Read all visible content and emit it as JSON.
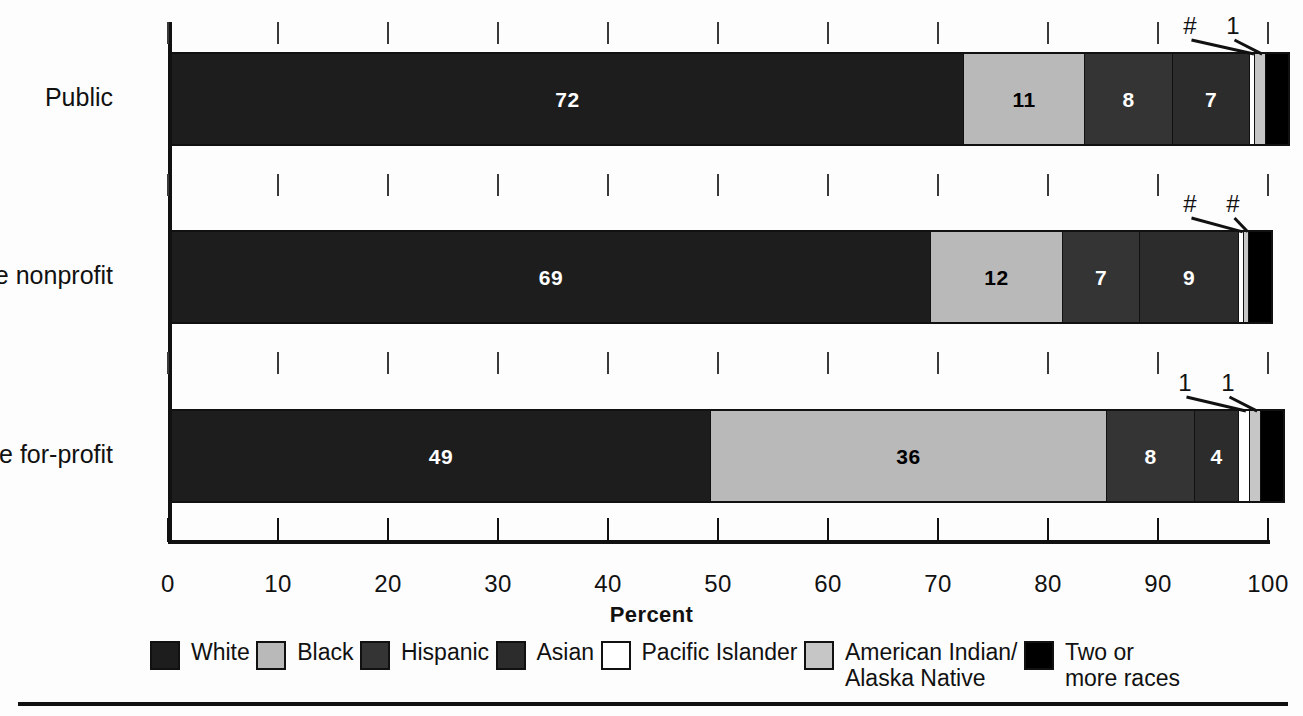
{
  "chart_data": {
    "type": "bar",
    "subtype": "stacked-horizontal-100",
    "title": "",
    "xlabel": "Percent",
    "ylabel": "",
    "xlim": [
      0,
      100
    ],
    "xticks": [
      0,
      10,
      20,
      30,
      40,
      50,
      60,
      70,
      80,
      90,
      100
    ],
    "xticklabels": [
      "0",
      "10",
      "20",
      "30",
      "40",
      "50",
      "60",
      "70",
      "80",
      "90",
      "100"
    ],
    "grid": false,
    "legend_position": "bottom",
    "categories": [
      "Public",
      "Private nonprofit",
      "Private for-profit"
    ],
    "series": [
      {
        "name": "White",
        "values": [
          72,
          69,
          49
        ],
        "color": "#1d1d1d"
      },
      {
        "name": "Black",
        "values": [
          11,
          12,
          36
        ],
        "color": "#b9b9b9"
      },
      {
        "name": "Hispanic",
        "values": [
          8,
          7,
          8
        ],
        "color": "#343434"
      },
      {
        "name": "Asian",
        "values": [
          7,
          9,
          4
        ],
        "color": "#2c2c2c"
      },
      {
        "name": "Pacific Islander",
        "values": [
          0,
          0,
          1
        ],
        "color": "#ffffff"
      },
      {
        "name": "American Indian/\nAlaska Native",
        "values": [
          1,
          0,
          1
        ],
        "color": "#c6c6c6"
      },
      {
        "name": "Two or\nmore races",
        "values": [
          2,
          2,
          2
        ],
        "color": "#000000"
      }
    ],
    "bar_labels": [
      [
        "72",
        "11",
        "8",
        "7",
        "#",
        "1",
        "2"
      ],
      [
        "69",
        "12",
        "7",
        "9",
        "#",
        "#",
        "2"
      ],
      [
        "49",
        "36",
        "8",
        "4",
        "1",
        "1",
        "2"
      ]
    ],
    "callout_symbol_hash": "#",
    "callout_symbol_one": "1",
    "note": "# = rounds to zero"
  },
  "axis": {
    "x_title": "Percent",
    "ticks": [
      {
        "value": 0,
        "label": "0"
      },
      {
        "value": 10,
        "label": "10"
      },
      {
        "value": 20,
        "label": "20"
      },
      {
        "value": 30,
        "label": "30"
      },
      {
        "value": 40,
        "label": "40"
      },
      {
        "value": 50,
        "label": "50"
      },
      {
        "value": 60,
        "label": "60"
      },
      {
        "value": 70,
        "label": "70"
      },
      {
        "value": 80,
        "label": "80"
      },
      {
        "value": 90,
        "label": "90"
      },
      {
        "value": 100,
        "label": "100"
      }
    ]
  },
  "categories": [
    {
      "label": "Public"
    },
    {
      "label": "Private nonprofit"
    },
    {
      "label": "Private for-profit"
    }
  ],
  "legend": {
    "items": [
      {
        "label": "White",
        "color": "#1d1d1d"
      },
      {
        "label": "Black",
        "color": "#b9b9b9"
      },
      {
        "label": "Hispanic",
        "color": "#343434"
      },
      {
        "label": "Asian",
        "color": "#2c2c2c"
      },
      {
        "label": "Pacific Islander",
        "color": "#ffffff"
      },
      {
        "label": "American Indian/\nAlaska Native",
        "color": "#c6c6c6"
      },
      {
        "label": "Two or\nmore races",
        "color": "#000000"
      }
    ]
  }
}
